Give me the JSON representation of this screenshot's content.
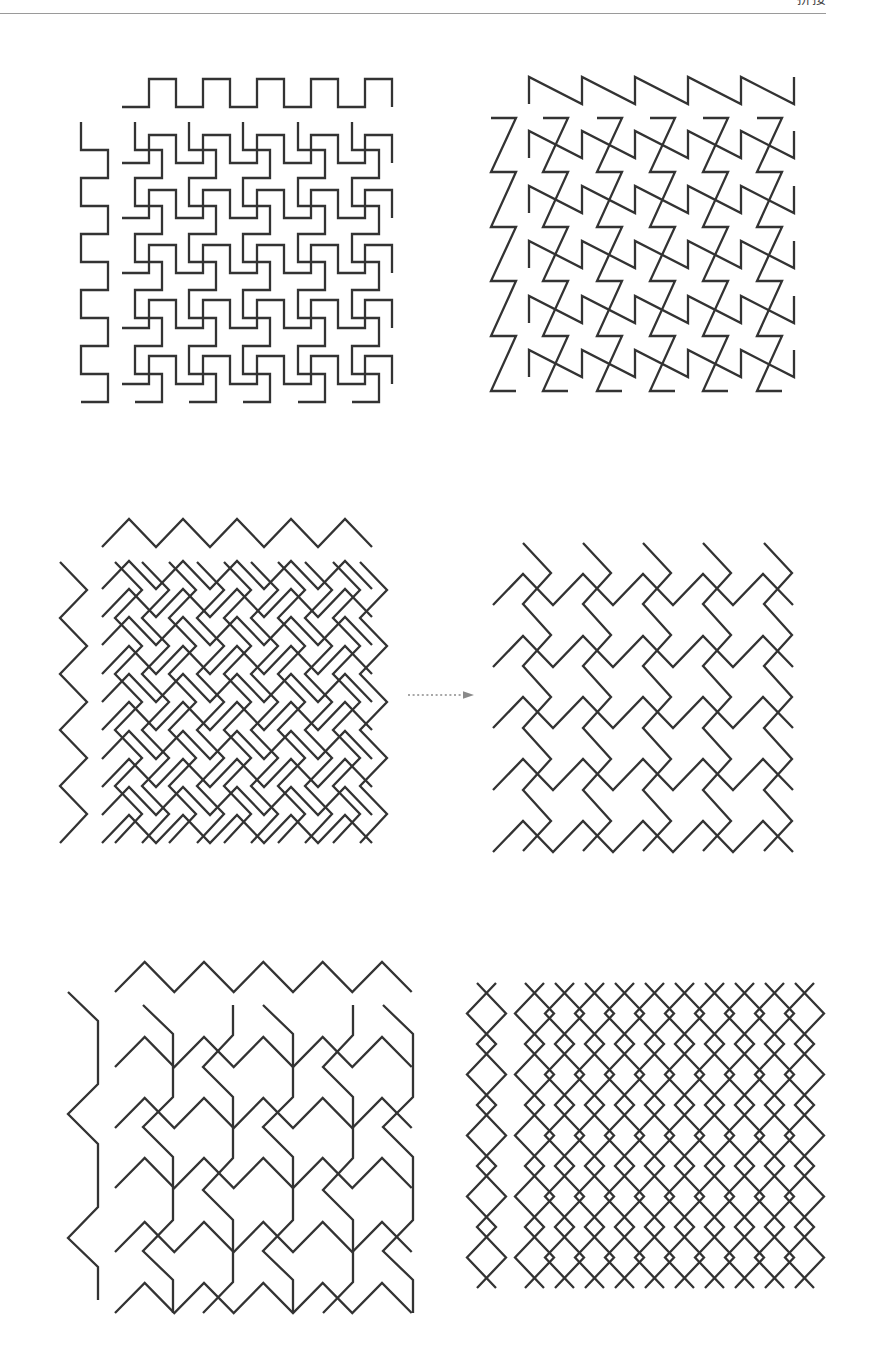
{
  "header": {
    "running_title": "拼接"
  },
  "style": {
    "line_color": "#333333",
    "line_width": 2.3,
    "arrow_color": "#8a8a8a",
    "rule_color": "#9a9a9a"
  },
  "arrow": {
    "from": [
      408,
      695
    ],
    "to": [
      463,
      695
    ],
    "head_tip": [
      474,
      695
    ],
    "head_half_height": 3.8,
    "dash": "2 2.6"
  },
  "panels": [
    {
      "motifs": [
        {
          "points": [
            [
              0,
              0
            ],
            [
              27,
              0
            ],
            [
              27,
              -28
            ],
            [
              54,
              -28
            ],
            [
              54,
              0
            ],
            [
              81,
              0
            ],
            [
              81,
              -28
            ],
            [
              108,
              -28
            ],
            [
              108,
              0
            ],
            [
              135,
              0
            ],
            [
              135,
              -28
            ],
            [
              162,
              -28
            ],
            [
              162,
              0
            ],
            [
              189,
              0
            ],
            [
              189,
              -28
            ],
            [
              216,
              -28
            ],
            [
              216,
              0
            ],
            [
              243,
              0
            ],
            [
              243,
              -28
            ],
            [
              270,
              -28
            ],
            [
              270,
              0
            ]
          ],
          "instances": [
            [
              122,
              107
            ],
            [
              122,
              163
            ],
            [
              122,
              218
            ],
            [
              122,
              273
            ],
            [
              122,
              328
            ],
            [
              122,
              384
            ]
          ]
        },
        {
          "points": [
            [
              0,
              0
            ],
            [
              0,
              28
            ],
            [
              27,
              28
            ],
            [
              27,
              56
            ],
            [
              0,
              56
            ],
            [
              0,
              84
            ],
            [
              27,
              84
            ],
            [
              27,
              112
            ],
            [
              0,
              112
            ],
            [
              0,
              140
            ],
            [
              27,
              140
            ],
            [
              27,
              168
            ],
            [
              0,
              168
            ],
            [
              0,
              196
            ],
            [
              27,
              196
            ],
            [
              27,
              224
            ],
            [
              0,
              224
            ],
            [
              0,
              252
            ],
            [
              27,
              252
            ],
            [
              27,
              280
            ],
            [
              0,
              280
            ]
          ],
          "instances": [
            [
              81,
              122
            ],
            [
              135,
              122
            ],
            [
              189,
              122
            ],
            [
              243,
              122
            ],
            [
              298,
              122
            ],
            [
              352,
              122
            ]
          ]
        }
      ]
    },
    {
      "motifs": [
        {
          "points": [
            [
              0,
              0
            ],
            [
              0,
              -27
            ],
            [
              53,
              0
            ],
            [
              53,
              -27
            ],
            [
              106,
              0
            ],
            [
              106,
              -27
            ],
            [
              159,
              0
            ],
            [
              159,
              -27
            ],
            [
              212,
              0
            ],
            [
              212,
              -27
            ],
            [
              265,
              0
            ],
            [
              265,
              -27
            ]
          ],
          "instances": [
            [
              529,
              104
            ],
            [
              529,
              158
            ],
            [
              529,
              213
            ],
            [
              529,
              268
            ],
            [
              529,
              323
            ],
            [
              529,
              377
            ]
          ]
        },
        {
          "points": [
            [
              0,
              0
            ],
            [
              25,
              0
            ],
            [
              0,
              54
            ],
            [
              25,
              54
            ],
            [
              0,
              109
            ],
            [
              25,
              109
            ],
            [
              0,
              163
            ],
            [
              25,
              163
            ],
            [
              0,
              218
            ],
            [
              25,
              218
            ],
            [
              0,
              273
            ],
            [
              25,
              273
            ]
          ],
          "instances": [
            [
              491,
              118
            ],
            [
              543,
              118
            ],
            [
              597,
              118
            ],
            [
              650,
              118
            ],
            [
              703,
              118
            ],
            [
              757,
              118
            ]
          ]
        }
      ]
    },
    {
      "motifs": [
        {
          "points": [
            [
              0,
              0
            ],
            [
              27,
              -28
            ],
            [
              54,
              0
            ],
            [
              81,
              -28
            ],
            [
              108,
              0
            ],
            [
              135,
              -28
            ],
            [
              162,
              0
            ],
            [
              189,
              -28
            ],
            [
              216,
              0
            ],
            [
              243,
              -28
            ],
            [
              270,
              0
            ]
          ],
          "instances": [
            [
              102,
              547
            ],
            [
              102,
              589
            ],
            [
              102,
              617
            ],
            [
              102,
              645
            ],
            [
              102,
              674
            ],
            [
              102,
              702
            ],
            [
              102,
              730
            ],
            [
              102,
              759
            ],
            [
              102,
              787
            ],
            [
              102,
              815
            ],
            [
              102,
              843
            ]
          ]
        },
        {
          "points": [
            [
              0,
              0
            ],
            [
              27,
              28
            ],
            [
              0,
              56
            ],
            [
              27,
              84
            ],
            [
              0,
              112
            ],
            [
              27,
              140
            ],
            [
              0,
              168
            ],
            [
              27,
              196
            ],
            [
              0,
              224
            ],
            [
              27,
              252
            ],
            [
              0,
              281
            ]
          ],
          "instances": [
            [
              60,
              562
            ],
            [
              115,
              562
            ],
            [
              142,
              562
            ],
            [
              169,
              562
            ],
            [
              197,
              562
            ],
            [
              224,
              562
            ],
            [
              251,
              562
            ],
            [
              278,
              562
            ],
            [
              305,
              562
            ],
            [
              333,
              562
            ],
            [
              360,
              562
            ]
          ]
        }
      ]
    },
    {
      "motifs": [
        {
          "points": [
            [
              0,
              0
            ],
            [
              30,
              -31
            ],
            [
              60,
              0
            ],
            [
              90,
              -31
            ],
            [
              120,
              0
            ],
            [
              150,
              -31
            ],
            [
              180,
              0
            ],
            [
              210,
              -31
            ],
            [
              240,
              0
            ],
            [
              270,
              -31
            ],
            [
              300,
              0
            ]
          ],
          "instances": [
            [
              493,
              605
            ],
            [
              493,
              667
            ],
            [
              493,
              728
            ],
            [
              493,
              790
            ],
            [
              493,
              852
            ]
          ]
        },
        {
          "points": [
            [
              0,
              0
            ],
            [
              28,
              30
            ],
            [
              0,
              61
            ],
            [
              28,
              92
            ],
            [
              0,
              123
            ],
            [
              28,
              154
            ],
            [
              0,
              185
            ],
            [
              28,
              216
            ],
            [
              0,
              247
            ],
            [
              28,
              278
            ],
            [
              0,
              308
            ]
          ],
          "instances": [
            [
              523,
              543
            ],
            [
              583,
              543
            ],
            [
              643,
              543
            ],
            [
              703,
              543
            ],
            [
              764,
              543
            ]
          ]
        }
      ]
    },
    {
      "motifs": [
        {
          "points": [
            [
              0,
              0
            ],
            [
              29.7,
              -30
            ],
            [
              59.3,
              0
            ],
            [
              89,
              -30
            ],
            [
              118.7,
              0
            ],
            [
              148.3,
              -30
            ],
            [
              178,
              0
            ],
            [
              207.7,
              -30
            ],
            [
              237.3,
              0
            ],
            [
              267,
              -30
            ],
            [
              296.7,
              0
            ]
          ],
          "instances": [
            [
              115,
              992
            ],
            [
              115,
              1067
            ],
            [
              115,
              1128
            ],
            [
              115,
              1188
            ],
            [
              115,
              1252
            ],
            [
              115,
              1313
            ]
          ]
        },
        {
          "points": [
            [
              0,
              0
            ],
            [
              30,
              29
            ],
            [
              30,
              92
            ],
            [
              0,
              122
            ],
            [
              30,
              152
            ],
            [
              30,
              215
            ],
            [
              0,
              246
            ],
            [
              30,
              275
            ],
            [
              30,
              308
            ]
          ],
          "instances": [
            [
              68,
              992
            ],
            [
              143,
              1005
            ],
            [
              263,
              1005
            ],
            [
              383,
              1005
            ]
          ]
        },
        {
          "points": [
            [
              30,
              0
            ],
            [
              30,
              30
            ],
            [
              0,
              62
            ],
            [
              30,
              92
            ],
            [
              30,
              153
            ],
            [
              0,
              185
            ],
            [
              30,
              215
            ],
            [
              30,
              277
            ],
            [
              0,
              308
            ]
          ],
          "instances": [
            [
              203,
              1005
            ],
            [
              323,
              1005
            ]
          ]
        }
      ]
    },
    {
      "motifs": [
        {
          "points": [
            [
              10,
              0
            ],
            [
              39,
              30.5
            ],
            [
              10,
              61
            ],
            [
              39,
              91.5
            ],
            [
              10,
              122
            ],
            [
              39,
              152.5
            ],
            [
              10,
              183
            ],
            [
              39,
              213.5
            ],
            [
              10,
              244
            ],
            [
              39,
              274.5
            ],
            [
              10,
              305
            ]
          ],
          "instances": [
            [
              467,
              983
            ],
            [
              515,
              983
            ],
            [
              545,
              983
            ],
            [
              575,
              983
            ],
            [
              605,
              983
            ],
            [
              635,
              983
            ],
            [
              665,
              983
            ],
            [
              695,
              983
            ],
            [
              725,
              983
            ],
            [
              755,
              983
            ],
            [
              785,
              983
            ]
          ]
        },
        {
          "points": [
            [
              29,
              0
            ],
            [
              0,
              30.5
            ],
            [
              29,
              61
            ],
            [
              0,
              91.5
            ],
            [
              29,
              122
            ],
            [
              0,
              152.5
            ],
            [
              29,
              183
            ],
            [
              0,
              213.5
            ],
            [
              29,
              244
            ],
            [
              0,
              274.5
            ],
            [
              29,
              305
            ]
          ],
          "instances": [
            [
              467,
              983
            ],
            [
              515,
              983
            ],
            [
              545,
              983
            ],
            [
              575,
              983
            ],
            [
              605,
              983
            ],
            [
              635,
              983
            ],
            [
              665,
              983
            ],
            [
              695,
              983
            ],
            [
              725,
              983
            ],
            [
              755,
              983
            ],
            [
              785,
              983
            ]
          ]
        }
      ]
    }
  ]
}
